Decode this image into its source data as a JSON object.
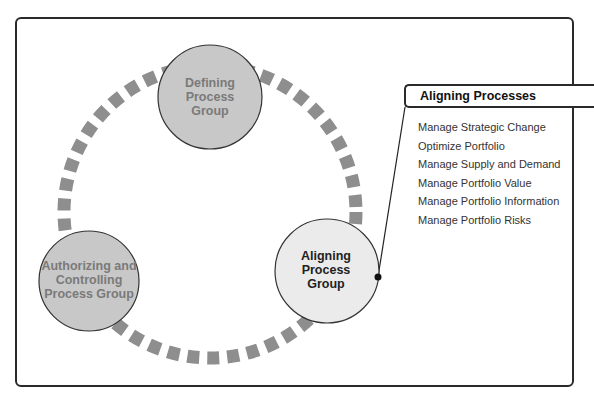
{
  "diagram": {
    "nodes": [
      {
        "id": "defining",
        "label_lines": [
          "Defining",
          "Process",
          "Group"
        ],
        "fill": "#c8c8c8",
        "text_color": "#7a7a7a"
      },
      {
        "id": "authorizing",
        "label_lines": [
          "Authorizing and",
          "Controlling",
          "Process Group"
        ],
        "fill": "#c8c8c8",
        "text_color": "#7a7a7a"
      },
      {
        "id": "aligning",
        "label_lines": [
          "Aligning",
          "Process",
          "Group"
        ],
        "fill": "#ebebeb",
        "text_color": "#222222"
      }
    ],
    "connector_color": "#8e8e8e",
    "panel": {
      "title": "Aligning Processes",
      "items": [
        "Manage Strategic Change",
        "Optimize Portfolio",
        "Manage Supply and Demand",
        "Manage Portfolio Value",
        "Manage Portfolio Information",
        "Manage Portfolio Risks"
      ]
    }
  }
}
